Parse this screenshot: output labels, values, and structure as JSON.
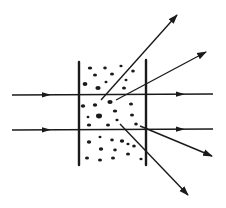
{
  "diagram": {
    "title": "",
    "colors": {
      "ink": "#1a1a1a",
      "background": "#ffffff"
    },
    "walls": [
      {
        "id": "left-wall",
        "x1": 79,
        "y1": 62,
        "x2": 79,
        "y2": 165
      },
      {
        "id": "right-wall",
        "x1": 146,
        "y1": 60,
        "x2": 146,
        "y2": 165
      }
    ],
    "incident_rays": [
      {
        "id": "upper-beam",
        "x1": 12,
        "y1": 95,
        "x2": 213,
        "y2": 94,
        "arrows_at": [
          48,
          182
        ]
      },
      {
        "id": "lower-beam",
        "x1": 12,
        "y1": 130,
        "x2": 213,
        "y2": 129,
        "arrows_at": [
          48,
          182
        ]
      }
    ],
    "scattered_rays": [
      {
        "id": "scatter-up-steep",
        "x1": 101,
        "y1": 100,
        "x2": 177,
        "y2": 15
      },
      {
        "id": "scatter-up-shallow",
        "x1": 116,
        "y1": 100,
        "x2": 206,
        "y2": 52
      },
      {
        "id": "scatter-down-shallow",
        "x1": 140,
        "y1": 126,
        "x2": 212,
        "y2": 156
      },
      {
        "id": "scatter-down-steep",
        "x1": 120,
        "y1": 124,
        "x2": 188,
        "y2": 195
      }
    ],
    "particles": [
      [
        90,
        68,
        2.2,
        1.6
      ],
      [
        105,
        68,
        1.8,
        1.4
      ],
      [
        121,
        66,
        1.6,
        1.3
      ],
      [
        133,
        71,
        1.8,
        1.5
      ],
      [
        95,
        75,
        2,
        1.5
      ],
      [
        112,
        74,
        2,
        1.6
      ],
      [
        126,
        80,
        1.5,
        1.3
      ],
      [
        85,
        84,
        2.4,
        2
      ],
      [
        98,
        88,
        2.6,
        2
      ],
      [
        106,
        82,
        1.5,
        1.2
      ],
      [
        124,
        88,
        2,
        1.6
      ],
      [
        83,
        106,
        2.2,
        1.8
      ],
      [
        95,
        105,
        2.2,
        1.8
      ],
      [
        110,
        102,
        2.6,
        2
      ],
      [
        131,
        104,
        2,
        1.6
      ],
      [
        88,
        117,
        1.4,
        1.2
      ],
      [
        99,
        116,
        3,
        2.4
      ],
      [
        115,
        111,
        2.2,
        1.6
      ],
      [
        132,
        115,
        2,
        1.6
      ],
      [
        89,
        125,
        2.2,
        1.5
      ],
      [
        108,
        125,
        2,
        1.5
      ],
      [
        136,
        124,
        1.8,
        1.5
      ],
      [
        117,
        120,
        1.6,
        1.3
      ],
      [
        100,
        137,
        1.5,
        1.2
      ],
      [
        112,
        140,
        1.8,
        1.4
      ],
      [
        122,
        141,
        2.2,
        1.8
      ],
      [
        134,
        146,
        1.8,
        1.5
      ],
      [
        89,
        142,
        2.2,
        1.8
      ],
      [
        101,
        149,
        2.2,
        1.7
      ],
      [
        115,
        150,
        1.8,
        1.4
      ],
      [
        128,
        154,
        2,
        1.6
      ],
      [
        87,
        158,
        2,
        1.6
      ],
      [
        100,
        160,
        2,
        1.6
      ],
      [
        113,
        158,
        2,
        1.6
      ],
      [
        141,
        159,
        1.6,
        1.3
      ],
      [
        128,
        144,
        1.6,
        1.3
      ]
    ]
  }
}
